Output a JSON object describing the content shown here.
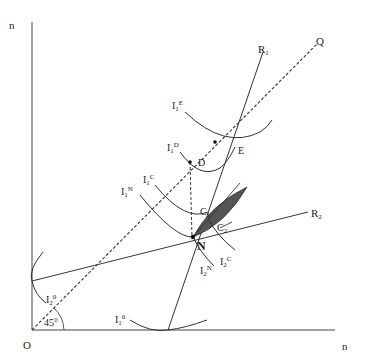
{
  "diagram": {
    "axes": {
      "y_label": "n",
      "x_label": "n",
      "origin_label": "O",
      "angle_label": "45°"
    },
    "lines": {
      "diagonal": {
        "label": "Q",
        "style": "dashed"
      },
      "reaction1": {
        "label": "R",
        "sub": "1"
      },
      "reaction2": {
        "label": "R",
        "sub": "2"
      }
    },
    "points": {
      "N": "N",
      "D": "D",
      "E": "E",
      "C1": {
        "label": "C",
        "sub": "1"
      },
      "C2": {
        "label": "C",
        "sub": "2"
      }
    },
    "isocurves": [
      {
        "id": "I1E",
        "label": "I",
        "sub": "1",
        "sup": "E"
      },
      {
        "id": "I1D",
        "label": "I",
        "sub": "1",
        "sup": "D"
      },
      {
        "id": "I1C",
        "label": "I",
        "sub": "1",
        "sup": "C"
      },
      {
        "id": "I1N",
        "label": "I",
        "sub": "1",
        "sup": "N"
      },
      {
        "id": "I2C",
        "label": "I",
        "sub": "2",
        "sup": "C"
      },
      {
        "id": "I2N",
        "label": "I",
        "sub": "2",
        "sup": "N"
      },
      {
        "id": "I20",
        "label": "I",
        "sub": "2",
        "sup": "0"
      },
      {
        "id": "I10",
        "label": "I",
        "sub": "1",
        "sup": "0"
      }
    ],
    "shaded_region": "lens between C1 and C2 above N"
  }
}
